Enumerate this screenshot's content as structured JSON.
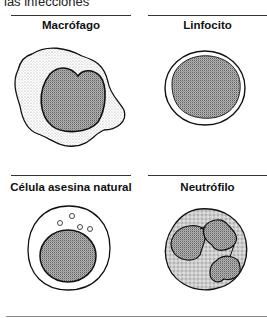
{
  "caption": "las infecciones",
  "cells": [
    {
      "label": "Macrófago",
      "icon": "macrophage-illustration"
    },
    {
      "label": "Linfocito",
      "icon": "lymphocyte-illustration"
    },
    {
      "label": "Célula asesina natural",
      "icon": "natural-killer-cell-illustration"
    },
    {
      "label": "Neutrófilo",
      "icon": "neutrophil-illustration"
    }
  ]
}
